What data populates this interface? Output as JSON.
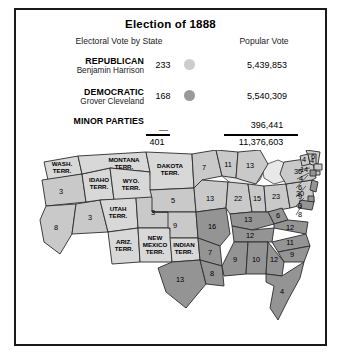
{
  "panel": {
    "title": "Election of 1888",
    "column_headers": {
      "electoral": "Electoral Vote by State",
      "popular": "Popular Vote"
    }
  },
  "colors": {
    "republican_swatch": "#cdcdcd",
    "democratic_swatch": "#9a9a9a",
    "republican_state": "#c9c9c9",
    "democratic_state": "#949494",
    "territory": "#d8d8d8",
    "border": "#2b2b2b"
  },
  "tally": {
    "rows": [
      {
        "party": "REPUBLICAN",
        "candidate": "Benjamin Harrison",
        "electoral": "233",
        "popular": "5,439,853"
      },
      {
        "party": "DEMOCRATIC",
        "candidate": "Grover Cleveland",
        "electoral": "168",
        "popular": "5,540,309"
      },
      {
        "party": "MINOR PARTIES",
        "candidate": "",
        "electoral": "—",
        "popular": "396,441"
      }
    ],
    "total_electoral": "401",
    "total_popular": "11,376,603"
  },
  "map": {
    "states": [
      {
        "name": "washington-territory",
        "label": "WASH.\nTERR.",
        "party": "territory"
      },
      {
        "name": "oregon",
        "label": "3",
        "party": "republican"
      },
      {
        "name": "california",
        "label": "8",
        "party": "republican"
      },
      {
        "name": "nevada",
        "label": "3",
        "party": "republican"
      },
      {
        "name": "idaho-territory",
        "label": "IDAHO\nTERR.",
        "party": "territory"
      },
      {
        "name": "montana-territory",
        "label": "MONTANA\nTERR.",
        "party": "territory"
      },
      {
        "name": "wyoming-territory",
        "label": "WYO.\nTERR.",
        "party": "territory"
      },
      {
        "name": "utah-territory",
        "label": "UTAH\nTERR.",
        "party": "territory"
      },
      {
        "name": "arizona-territory",
        "label": "ARIZ.\nTERR.",
        "party": "territory"
      },
      {
        "name": "new-mexico-territory",
        "label": "NEW\nMEXICO\nTERR.",
        "party": "territory"
      },
      {
        "name": "dakota-territory",
        "label": "DAKOTA\nTERR.",
        "party": "territory"
      },
      {
        "name": "indian-territory",
        "label": "INDIAN\nTERR.",
        "party": "territory"
      },
      {
        "name": "colorado",
        "label": "3",
        "party": "republican"
      },
      {
        "name": "nebraska",
        "label": "5",
        "party": "republican"
      },
      {
        "name": "kansas",
        "label": "9",
        "party": "republican"
      },
      {
        "name": "minnesota",
        "label": "7",
        "party": "republican"
      },
      {
        "name": "iowa",
        "label": "13",
        "party": "republican"
      },
      {
        "name": "missouri",
        "label": "16",
        "party": "democratic"
      },
      {
        "name": "arkansas",
        "label": "7",
        "party": "democratic"
      },
      {
        "name": "texas",
        "label": "13",
        "party": "democratic"
      },
      {
        "name": "louisiana",
        "label": "8",
        "party": "democratic"
      },
      {
        "name": "wisconsin",
        "label": "11",
        "party": "republican"
      },
      {
        "name": "michigan",
        "label": "13",
        "party": "republican"
      },
      {
        "name": "illinois",
        "label": "22",
        "party": "republican"
      },
      {
        "name": "indiana",
        "label": "15",
        "party": "republican"
      },
      {
        "name": "ohio",
        "label": "23",
        "party": "republican"
      },
      {
        "name": "pennsylvania",
        "label": "30",
        "party": "republican"
      },
      {
        "name": "new-york",
        "label": "36",
        "party": "republican"
      },
      {
        "name": "west-virginia",
        "label": "6",
        "party": "democratic"
      },
      {
        "name": "kentucky",
        "label": "13",
        "party": "democratic"
      },
      {
        "name": "tennessee",
        "label": "12",
        "party": "democratic"
      },
      {
        "name": "virginia",
        "label": "12",
        "party": "democratic"
      },
      {
        "name": "north-carolina",
        "label": "11",
        "party": "democratic"
      },
      {
        "name": "south-carolina",
        "label": "9",
        "party": "democratic"
      },
      {
        "name": "georgia",
        "label": "12",
        "party": "democratic"
      },
      {
        "name": "alabama",
        "label": "10",
        "party": "democratic"
      },
      {
        "name": "mississippi",
        "label": "9",
        "party": "democratic"
      },
      {
        "name": "florida",
        "label": "4",
        "party": "democratic"
      },
      {
        "name": "maine",
        "label": "6",
        "party": "republican"
      },
      {
        "name": "vermont",
        "label": "4",
        "party": "republican"
      },
      {
        "name": "new-hampshire",
        "label": "4",
        "party": "republican"
      }
    ],
    "callouts": [
      {
        "name": "massachusetts",
        "label": "14",
        "party": "republican"
      },
      {
        "name": "rhode-island",
        "label": "4",
        "party": "republican"
      },
      {
        "name": "connecticut",
        "label": "6",
        "party": "democratic"
      },
      {
        "name": "new-jersey",
        "label": "9",
        "party": "democratic"
      },
      {
        "name": "delaware",
        "label": "3",
        "party": "democratic"
      },
      {
        "name": "maryland",
        "label": "8",
        "party": "democratic"
      }
    ]
  }
}
